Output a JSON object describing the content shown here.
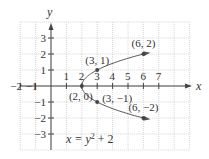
{
  "chart_data": {
    "type": "line",
    "title": "",
    "equation": "x = y² + 2",
    "equation_parts": {
      "lhs": "x = y",
      "exp": "2",
      "rhs": " + 2"
    },
    "xlabel": "x",
    "ylabel": "y",
    "xlim": [
      -2,
      9
    ],
    "ylim": [
      -4,
      4
    ],
    "grid": true,
    "x_ticks": [
      -2,
      -1,
      1,
      2,
      3,
      4,
      5,
      6,
      7
    ],
    "x_tick_labels": [
      "−2",
      "−1",
      "1",
      "2",
      "3",
      "4",
      "5",
      "6",
      "7"
    ],
    "y_ticks": [
      3,
      2,
      1,
      -1,
      -2,
      -3
    ],
    "y_tick_labels": [
      "3",
      "2",
      "1",
      "−1",
      "−2",
      "−3"
    ],
    "series": [
      {
        "name": "upper branch",
        "x": [
          2,
          3,
          6
        ],
        "y": [
          0,
          1,
          2
        ]
      },
      {
        "name": "lower branch",
        "x": [
          2,
          3,
          6
        ],
        "y": [
          0,
          -1,
          -2
        ]
      }
    ],
    "points": [
      {
        "x": 2,
        "y": 0,
        "label": "(2, 0)"
      },
      {
        "x": 3,
        "y": 1,
        "label": "(3, 1)"
      },
      {
        "x": 6,
        "y": 2,
        "label": "(6, 2)"
      },
      {
        "x": 3,
        "y": -1,
        "label": "(3, −1)"
      },
      {
        "x": 6,
        "y": -2,
        "label": "(6, −2)"
      }
    ],
    "colors": {
      "axis": "#444444",
      "curve": "#555555",
      "grid": "#bbbbbb",
      "point": "#444444"
    }
  }
}
